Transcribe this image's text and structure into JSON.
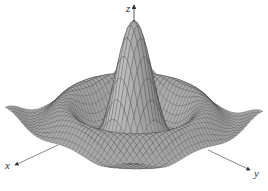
{
  "chart_data": {
    "type": "surface",
    "title": "",
    "function_description": "radially symmetric damped sinc surface z = sin(r)/r with a tall central peak and concentric ripples",
    "axes": {
      "x": {
        "label": "x"
      },
      "y": {
        "label": "y"
      },
      "z": {
        "label": "z"
      }
    },
    "grid": true,
    "mesh_resolution": 40,
    "domain": {
      "min": -10,
      "max": 10
    },
    "peak_height": 1.0,
    "colors": {
      "surface_fill": "#a9a9a9",
      "surface_dark": "#6f6f6f",
      "mesh_line": "#3a3a3a",
      "axis_line": "#555555",
      "background": "#ffffff"
    }
  },
  "labels": {
    "x": "x",
    "y": "y",
    "z": "z"
  }
}
